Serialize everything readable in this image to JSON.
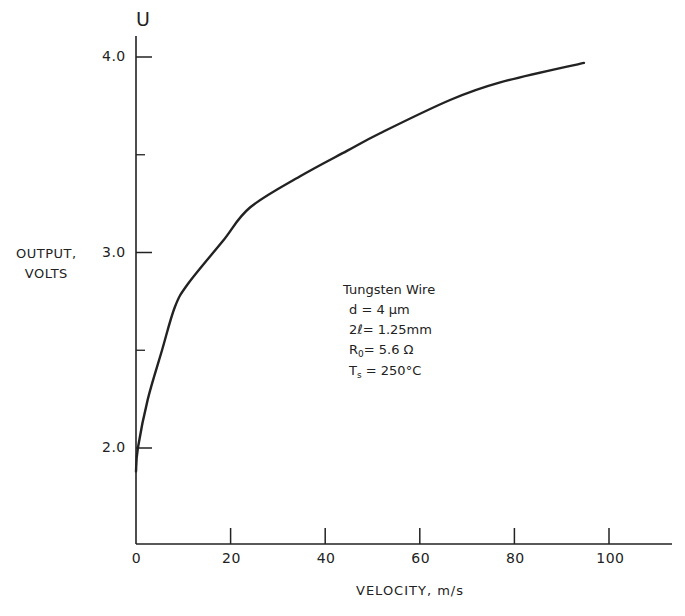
{
  "chart_data": {
    "type": "line",
    "title": "",
    "xlabel": "VELOCITY, m/s",
    "ylabel": "OUTPUT, VOLTS",
    "ylabel_line1": "OUTPUT,",
    "ylabel_line2": "VOLTS",
    "y_symbol": "U",
    "xlim": [
      0,
      113
    ],
    "ylim": [
      1.5,
      4.1
    ],
    "x_ticks": [
      0,
      20,
      40,
      60,
      80,
      100
    ],
    "x_tick_labels": [
      "0",
      "20",
      "40",
      "60",
      "80",
      "100"
    ],
    "y_ticks": [
      2.0,
      3.0,
      4.0
    ],
    "y_tick_labels": [
      "2.0",
      "3.0",
      "4.0"
    ],
    "y_minor_ticks": [
      2.5,
      3.5
    ],
    "grid": false,
    "legend": null,
    "series": [
      {
        "name": "Tungsten Wire",
        "x": [
          0,
          0.4,
          2.5,
          5.5,
          8.2,
          11,
          18.4,
          24.1,
          34.7,
          44.6,
          51.6,
          66.4,
          77,
          94.7
        ],
        "y": [
          1.88,
          2.0,
          2.25,
          2.5,
          2.72,
          2.84,
          3.06,
          3.23,
          3.39,
          3.52,
          3.61,
          3.78,
          3.87,
          3.97
        ]
      }
    ],
    "annotations": {
      "title": "Tungsten Wire",
      "d": "d = 4 μm",
      "length": "2ℓ= 1.25mm",
      "r0_main": "R",
      "r0_sub": "0",
      "r0_rest": "= 5.6 Ω",
      "ts_main": "T",
      "ts_sub": "s",
      "ts_rest": " = 250°C"
    },
    "colors": {
      "line": "#222222",
      "axis": "#222222",
      "background": "#ffffff"
    }
  }
}
